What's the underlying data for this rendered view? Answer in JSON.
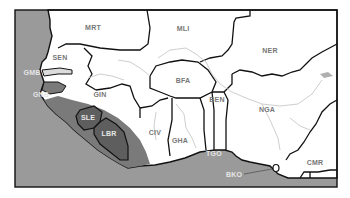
{
  "map": {
    "region": "West Africa",
    "colors": {
      "ocean": "#9a9a9a",
      "land": "#ffffff",
      "highlight_dark": "#5e5e5e",
      "highlight_band": "#7a7a7a",
      "border": "#111111",
      "river": "#c8c8c8",
      "label_on_land": "#777777",
      "label_on_dark": "#e6e6e6"
    },
    "labels": [
      {
        "code": "MRT",
        "x": 93,
        "y": 27,
        "tone": "dark"
      },
      {
        "code": "MLI",
        "x": 183,
        "y": 28,
        "tone": "dark"
      },
      {
        "code": "NER",
        "x": 270,
        "y": 50,
        "tone": "dark"
      },
      {
        "code": "SEN",
        "x": 60,
        "y": 57,
        "tone": "dark"
      },
      {
        "code": "GMB",
        "x": 32,
        "y": 72,
        "tone": "light"
      },
      {
        "code": "GNB",
        "x": 41,
        "y": 94,
        "tone": "light"
      },
      {
        "code": "GIN",
        "x": 100,
        "y": 94,
        "tone": "dark"
      },
      {
        "code": "BFA",
        "x": 183,
        "y": 80,
        "tone": "dark"
      },
      {
        "code": "BEN",
        "x": 217,
        "y": 99,
        "tone": "dark"
      },
      {
        "code": "NGA",
        "x": 267,
        "y": 109,
        "tone": "dark"
      },
      {
        "code": "SLE",
        "x": 88,
        "y": 117,
        "tone": "light"
      },
      {
        "code": "LBR",
        "x": 109,
        "y": 133,
        "tone": "light"
      },
      {
        "code": "CIV",
        "x": 155,
        "y": 132,
        "tone": "dark"
      },
      {
        "code": "GHA",
        "x": 180,
        "y": 140,
        "tone": "dark"
      },
      {
        "code": "TGO",
        "x": 214,
        "y": 153,
        "tone": "light"
      },
      {
        "code": "CMR",
        "x": 315,
        "y": 162,
        "tone": "dark"
      },
      {
        "code": "BKO",
        "x": 234,
        "y": 174,
        "tone": "light"
      }
    ]
  }
}
